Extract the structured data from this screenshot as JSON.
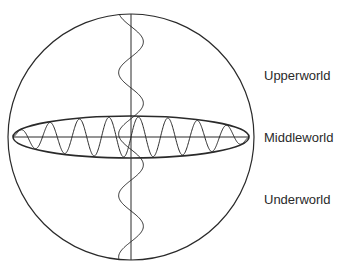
{
  "diagram": {
    "labels": {
      "upper": "Upperworld",
      "middle": "Middleworld",
      "under": "Underworld"
    },
    "caption": "",
    "colors": {
      "stroke": "#2a2a2a",
      "background": "#ffffff",
      "text": "#2a2a2a"
    },
    "geometry": {
      "sphere": {
        "cx": 131,
        "cy": 137,
        "r": 123
      },
      "equator_ellipse": {
        "cx": 131,
        "cy": 137,
        "rx": 118,
        "ry": 21
      },
      "vertical_axis_x": 131,
      "horizontal_axis_y": 137,
      "vertical_wave": {
        "cycles": 4,
        "amplitude": 13
      },
      "horizontal_wave": {
        "cycles": 8
      }
    }
  }
}
